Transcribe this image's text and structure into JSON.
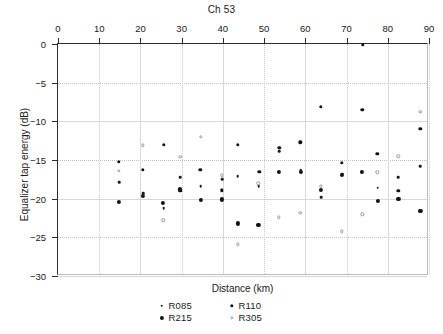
{
  "chart_data": {
    "type": "scatter",
    "title": "Ch 53",
    "xlabel": "Distance (km)",
    "ylabel": "Equalizer tap energy (dB)",
    "xlim": [
      0,
      90
    ],
    "ylim": [
      -30,
      0
    ],
    "xticks": [
      0,
      10,
      20,
      30,
      40,
      50,
      60,
      70,
      80,
      90
    ],
    "yticks": [
      0,
      -5,
      -10,
      -15,
      -20,
      -25,
      -30
    ],
    "xtick_labels": [
      "0",
      "10",
      "20",
      "30",
      "40",
      "50",
      "60",
      "70",
      "80",
      "90"
    ],
    "ytick_labels": [
      "0",
      "−5",
      "−10",
      "−15",
      "−20",
      "−25",
      "−30"
    ],
    "grid": true,
    "legend_position": "below-axes",
    "series": [
      {
        "name": "R085",
        "marker": "small-dot",
        "color": "#1c1c1c",
        "points": [
          [
            14.8,
            -17.9
          ],
          [
            20.6,
            -19.3
          ],
          [
            25.6,
            -21.2
          ],
          [
            29.6,
            -17.2
          ],
          [
            29.8,
            -18.7
          ],
          [
            34.6,
            -18.4
          ],
          [
            39.8,
            -17.5
          ],
          [
            43.6,
            -17.1
          ],
          [
            48.7,
            -18.4
          ],
          [
            53.6,
            -13.9
          ],
          [
            58.9,
            -16.3
          ],
          [
            63.9,
            -19.8
          ],
          [
            68.9,
            -16.8
          ],
          [
            77.6,
            -18.6
          ],
          [
            82.6,
            -17.2
          ],
          [
            87.9,
            -15.8
          ]
        ]
      },
      {
        "name": "R110",
        "marker": "medium-dot",
        "color": "#111111",
        "points": [
          [
            14.8,
            -15.2
          ],
          [
            20.5,
            -16.3
          ],
          [
            25.6,
            -13.0
          ],
          [
            29.7,
            -19.0
          ],
          [
            34.5,
            -16.3
          ],
          [
            39.7,
            -18.9
          ],
          [
            43.6,
            -13.0
          ],
          [
            48.8,
            -16.5
          ],
          [
            53.7,
            -13.4
          ],
          [
            58.8,
            -12.7
          ],
          [
            63.8,
            -8.1
          ],
          [
            68.9,
            -15.4
          ],
          [
            73.9,
            -0.1
          ],
          [
            73.8,
            -8.5
          ],
          [
            77.5,
            -14.2
          ],
          [
            82.6,
            -19.0
          ],
          [
            87.9,
            -11.0
          ]
        ]
      },
      {
        "name": "R215",
        "marker": "large-dot",
        "color": "#141414",
        "points": [
          [
            14.7,
            -20.4
          ],
          [
            20.6,
            -19.6
          ],
          [
            25.5,
            -20.5
          ],
          [
            29.6,
            -18.8
          ],
          [
            34.6,
            -20.2
          ],
          [
            39.7,
            -20.1
          ],
          [
            43.7,
            -23.2
          ],
          [
            48.6,
            -23.4
          ],
          [
            53.6,
            -16.5
          ],
          [
            58.9,
            -16.5
          ],
          [
            63.8,
            -18.9
          ],
          [
            68.9,
            -16.9
          ],
          [
            73.8,
            -16.5
          ],
          [
            77.6,
            -20.3
          ],
          [
            82.6,
            -20.0
          ],
          [
            87.9,
            -21.6
          ]
        ]
      },
      {
        "name": "R305",
        "marker": "open-circle",
        "color": "#9a9a9a",
        "points": [
          [
            14.8,
            -16.4
          ],
          [
            20.6,
            -13.1
          ],
          [
            25.5,
            -22.8
          ],
          [
            29.7,
            -14.6
          ],
          [
            34.6,
            -12.0
          ],
          [
            39.7,
            -17.0
          ],
          [
            43.6,
            -25.9
          ],
          [
            48.6,
            -18.0
          ],
          [
            53.6,
            -22.4
          ],
          [
            58.8,
            -21.8
          ],
          [
            63.8,
            -18.4
          ],
          [
            68.9,
            -24.2
          ],
          [
            73.8,
            -22.0
          ],
          [
            77.5,
            -16.6
          ],
          [
            82.6,
            -14.5
          ],
          [
            87.9,
            -8.8
          ]
        ]
      }
    ]
  },
  "legend": {
    "rows": [
      [
        {
          "label": "R085",
          "series": "R085"
        },
        {
          "label": "R110",
          "series": "R110"
        }
      ],
      [
        {
          "label": "R215",
          "series": "R215"
        },
        {
          "label": "R305",
          "series": "R305"
        }
      ]
    ]
  }
}
